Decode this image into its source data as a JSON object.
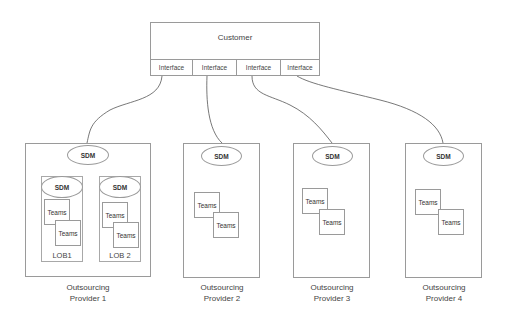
{
  "customer": {
    "label": "Customer",
    "interfaces": [
      {
        "label": "Interface"
      },
      {
        "label": "Interface"
      },
      {
        "label": "Interface"
      },
      {
        "label": "Interface"
      }
    ]
  },
  "providers": [
    {
      "sdm": "SDM",
      "label_line1": "Outsourcing",
      "label_line2": "Provider 1",
      "lobs": [
        {
          "sdm": "SDM",
          "teams": [
            "Teams",
            "Teams"
          ],
          "label": "LOB1"
        },
        {
          "sdm": "SDM",
          "teams": [
            "Teams",
            "Teams"
          ],
          "label": "LOB 2"
        }
      ]
    },
    {
      "sdm": "SDM",
      "label_line1": "Outsourcing",
      "label_line2": "Provider 2",
      "teams": [
        "Teams",
        "Teams"
      ]
    },
    {
      "sdm": "SDM",
      "label_line1": "Outsourcing",
      "label_line2": "Provider 3",
      "teams": [
        "Teams",
        "Teams"
      ]
    },
    {
      "sdm": "SDM",
      "label_line1": "Outsourcing",
      "label_line2": "Provider 4",
      "teams": [
        "Teams",
        "Teams"
      ]
    }
  ],
  "colors": {
    "stroke": "#9a9a9a",
    "connector": "#555555",
    "text": "#333333"
  }
}
